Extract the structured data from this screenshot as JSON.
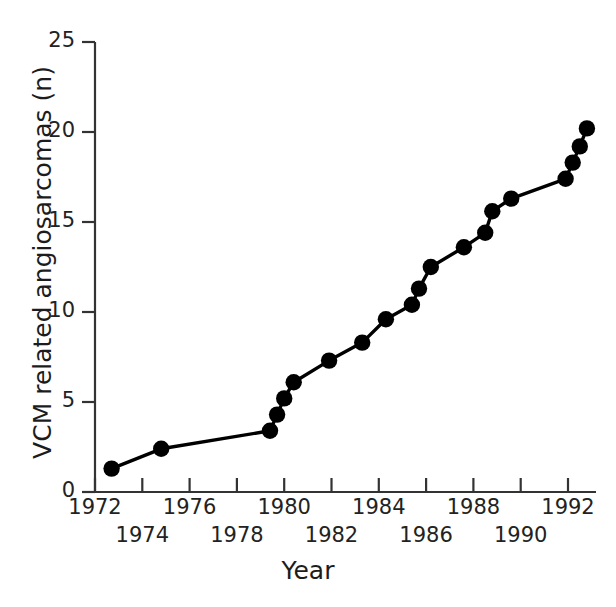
{
  "chart_data": {
    "type": "line",
    "title": "",
    "xlabel": "Year",
    "ylabel": "VCM related angiosarcomas (n)",
    "xlim": [
      1972,
      1993
    ],
    "ylim": [
      0,
      25
    ],
    "grid": false,
    "legend": "none",
    "marker": "filled-circle",
    "line_color": "#000000",
    "marker_color": "#000000",
    "x_tick_labels_upper": [
      "1972",
      "1976",
      "1980",
      "1984",
      "1988",
      "1992"
    ],
    "x_tick_labels_lower": [
      "1974",
      "1978",
      "1982",
      "1986",
      "1990"
    ],
    "x_ticks": [
      1972,
      1974,
      1976,
      1978,
      1980,
      1982,
      1984,
      1986,
      1988,
      1990,
      1992
    ],
    "y_ticks": [
      0,
      5,
      10,
      15,
      20,
      25
    ],
    "y_tick_labels": [
      "0",
      "5",
      "10",
      "15",
      "20",
      "25"
    ],
    "series": [
      {
        "name": "VCM related angiosarcomas",
        "points": [
          {
            "x": 1972.7,
            "y": 1.3
          },
          {
            "x": 1974.8,
            "y": 2.4
          },
          {
            "x": 1979.4,
            "y": 3.4
          },
          {
            "x": 1979.7,
            "y": 4.3
          },
          {
            "x": 1980.0,
            "y": 5.2
          },
          {
            "x": 1980.4,
            "y": 6.1
          },
          {
            "x": 1981.9,
            "y": 7.3
          },
          {
            "x": 1983.3,
            "y": 8.3
          },
          {
            "x": 1984.3,
            "y": 9.6
          },
          {
            "x": 1985.4,
            "y": 10.4
          },
          {
            "x": 1985.7,
            "y": 11.3
          },
          {
            "x": 1986.2,
            "y": 12.5
          },
          {
            "x": 1987.6,
            "y": 13.6
          },
          {
            "x": 1988.5,
            "y": 14.4
          },
          {
            "x": 1988.8,
            "y": 15.6
          },
          {
            "x": 1989.6,
            "y": 16.3
          },
          {
            "x": 1991.9,
            "y": 17.4
          },
          {
            "x": 1992.2,
            "y": 18.3
          },
          {
            "x": 1992.5,
            "y": 19.2
          },
          {
            "x": 1992.8,
            "y": 20.2
          }
        ]
      }
    ]
  }
}
